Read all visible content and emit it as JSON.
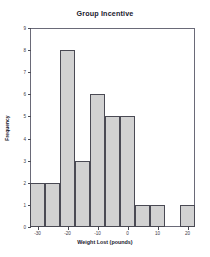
{
  "chart_data": {
    "type": "bar",
    "title": "Group Incentive",
    "xlabel": "Weight Lost (pounds)",
    "ylabel": "Frequency",
    "grid": false,
    "legend": null,
    "xlim": [
      -32.5,
      22.5
    ],
    "ylim": [
      0,
      9
    ],
    "bin_width": 5,
    "bin_edges": [
      -32.5,
      -27.5,
      -22.5,
      -17.5,
      -12.5,
      -7.5,
      -2.5,
      2.5,
      7.5,
      12.5,
      17.5,
      22.5
    ],
    "bin_centers": [
      -30,
      -25,
      -20,
      -15,
      -10,
      -5,
      0,
      5,
      10,
      15,
      20
    ],
    "categories": [
      "-32.5 to -27.5",
      "-27.5 to -22.5",
      "-22.5 to -17.5",
      "-17.5 to -12.5",
      "-12.5 to -7.5",
      "-7.5 to -2.5",
      "-2.5 to 2.5",
      "2.5 to 7.5",
      "7.5 to 12.5",
      "12.5 to 17.5",
      "17.5 to 22.5"
    ],
    "values": [
      2,
      2,
      8,
      3,
      6,
      5,
      5,
      1,
      1,
      0,
      1
    ],
    "xticks": [
      -30,
      -20,
      -10,
      0,
      10,
      20
    ],
    "xtick_labels": [
      "-30",
      "-20",
      "-10",
      "0",
      "10",
      "20"
    ],
    "yticks": [
      0,
      1,
      2,
      3,
      4,
      5,
      6,
      7,
      8,
      9
    ],
    "ytick_labels": [
      "0",
      "1",
      "2",
      "3",
      "4",
      "5",
      "6",
      "7",
      "8",
      "9"
    ],
    "colors": {
      "bar_fill": "#d2d2d2",
      "bar_edge": "#4a4a54",
      "frame": "#6a6a78",
      "text": "#1a1a2e",
      "background": "#ffffff"
    }
  }
}
